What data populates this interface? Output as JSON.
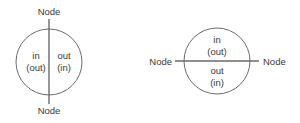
{
  "diagrams": [
    {
      "orientation": "vertical",
      "top_node": "Node",
      "bottom_node": "Node",
      "left_half": {
        "line1": "in",
        "line2": "(out)"
      },
      "right_half": {
        "line1": "out",
        "line2": "(in)"
      }
    },
    {
      "orientation": "horizontal",
      "left_node": "Node",
      "right_node": "Node",
      "top_half": {
        "line1": "in",
        "line2": "(out)"
      },
      "bottom_half": {
        "line1": "out",
        "line2": "(in)"
      }
    }
  ],
  "colors": {
    "line": "#6a6a6a",
    "text": "#3a3a3a",
    "background": "#ffffff"
  }
}
